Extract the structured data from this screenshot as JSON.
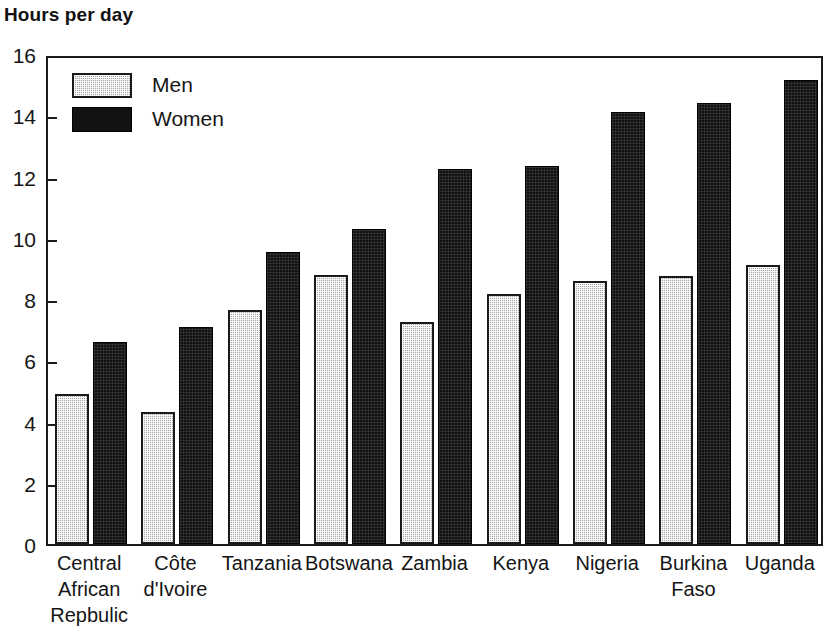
{
  "chart_data": {
    "type": "bar",
    "title": "Hours per day",
    "xlabel": "",
    "ylabel": "Hours per day",
    "ylim": [
      0,
      16
    ],
    "ytick_step": 2,
    "yticks": [
      16,
      14,
      12,
      10,
      8,
      6,
      4,
      2,
      0
    ],
    "grid": false,
    "legend_position": "top-left-inside",
    "categories": [
      "Central African Repbulic",
      "Côte d'Ivoire",
      "Tanzania",
      "Botswana",
      "Zambia",
      "Kenya",
      "Nigeria",
      "Burkina Faso",
      "Uganda"
    ],
    "category_lines": [
      [
        "Central",
        "African",
        "Repbulic"
      ],
      [
        "Côte",
        "d'Ivoire"
      ],
      [
        "Tanzania"
      ],
      [
        "Botswana"
      ],
      [
        "Zambia"
      ],
      [
        "Kenya"
      ],
      [
        "Nigeria"
      ],
      [
        "Burkina",
        "Faso"
      ],
      [
        "Uganda"
      ]
    ],
    "series": [
      {
        "name": "Men",
        "color": "#a8a8a8",
        "values": [
          4.9,
          4.3,
          7.65,
          8.8,
          7.25,
          8.15,
          8.6,
          8.75,
          9.1
        ]
      },
      {
        "name": "Women",
        "color": "#121212",
        "values": [
          6.6,
          7.1,
          9.55,
          10.3,
          12.25,
          12.35,
          14.1,
          14.4,
          15.15
        ]
      }
    ]
  },
  "legend": {
    "items": [
      {
        "label": "Men",
        "swatch": "men"
      },
      {
        "label": "Women",
        "swatch": "women"
      }
    ]
  }
}
